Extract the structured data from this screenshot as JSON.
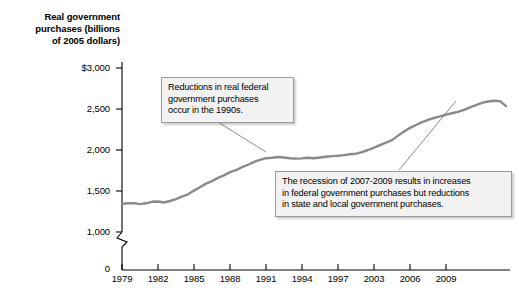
{
  "chart_data": {
    "type": "line",
    "title": "",
    "ylabel": "Real government purchases (billions of 2005 dollars)",
    "xlabel": "",
    "grid": false,
    "legend": null,
    "axis_break": true,
    "ylim": [
      0,
      3000
    ],
    "y_ticks": [
      "0",
      "1,000",
      "1,500",
      "2,000",
      "2,500",
      "$3,000"
    ],
    "y_tick_values": [
      0,
      1000,
      1500,
      2000,
      2500,
      3000
    ],
    "x_ticks": [
      "1979",
      "1982",
      "1985",
      "1988",
      "1991",
      "1994",
      "1997",
      "2003",
      "2006",
      "2009"
    ],
    "x_tick_values": [
      1979,
      1982,
      1985,
      1988,
      1991,
      1994,
      1997,
      2000,
      2003,
      2006
    ],
    "xlim": [
      1979,
      2011.5
    ],
    "series": [
      {
        "name": "Real government purchases",
        "color": "#8a8a8a",
        "x": [
          1979,
          1979.5,
          1980,
          1980.5,
          1981,
          1981.5,
          1982,
          1982.5,
          1983,
          1983.5,
          1984,
          1984.5,
          1985,
          1985.5,
          1986,
          1986.5,
          1987,
          1987.5,
          1988,
          1988.5,
          1989,
          1989.5,
          1990,
          1990.5,
          1991,
          1991.5,
          1992,
          1992.5,
          1993,
          1993.5,
          1994,
          1994.5,
          1995,
          1995.5,
          1996,
          1996.5,
          1997,
          1997.5,
          1998,
          1998.5,
          1999,
          1999.5,
          2000,
          2000.5,
          2001,
          2001.5,
          2002,
          2002.5,
          2003,
          2003.5,
          2004,
          2004.5,
          2005,
          2005.5,
          2006,
          2006.5,
          2007,
          2007.5,
          2008,
          2008.5,
          2009,
          2009.5,
          2010,
          2010.5,
          2011
        ],
        "y": [
          1345,
          1350,
          1352,
          1340,
          1350,
          1368,
          1372,
          1360,
          1378,
          1400,
          1432,
          1460,
          1505,
          1545,
          1590,
          1620,
          1660,
          1690,
          1730,
          1755,
          1790,
          1820,
          1855,
          1880,
          1900,
          1905,
          1915,
          1908,
          1900,
          1895,
          1898,
          1905,
          1900,
          1908,
          1918,
          1925,
          1930,
          1938,
          1948,
          1955,
          1975,
          2000,
          2030,
          2060,
          2090,
          2120,
          2175,
          2225,
          2270,
          2305,
          2340,
          2368,
          2390,
          2410,
          2432,
          2448,
          2465,
          2490,
          2520,
          2548,
          2575,
          2592,
          2600,
          2596,
          2535
        ]
      }
    ],
    "annotations": [
      {
        "id": "callout-1990s",
        "lines": [
          "Reductions in real federal",
          "government purchases",
          "occur in the 1990s."
        ],
        "target_x": 1992.1,
        "target_y": 1905
      },
      {
        "id": "callout-recession",
        "lines": [
          "The recession of 2007-2009 results in increases",
          "in federal government purchases but reductions",
          "in state and local government purchases."
        ],
        "target_x": 2008.6,
        "target_y": 2552
      }
    ]
  },
  "y_axis_title": {
    "line1": "Real government",
    "line2": "purchases (billions",
    "line3": "of 2005 dollars)"
  },
  "colors": {
    "line": "#8a8a8a",
    "axis": "#000000",
    "callout_fill": "#f2f2f2",
    "callout_border": "#9a9a9a"
  }
}
